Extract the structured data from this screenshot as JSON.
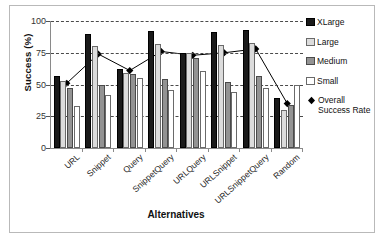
{
  "chart_data": {
    "type": "bar",
    "title": "",
    "xlabel": "Alternatives",
    "ylabel": "Success (%)",
    "ylim": [
      0,
      100
    ],
    "yticks": [
      0,
      25,
      50,
      75,
      100
    ],
    "grid": true,
    "legend_position": "right",
    "categories": [
      "URL",
      "Snippet",
      "Query",
      "SnippetQuery",
      "URLQuery",
      "URLSnippet",
      "URLSnippetQuery",
      "Random"
    ],
    "series": [
      {
        "name": "XLarge",
        "color": "#1a1a1a",
        "values": [
          57,
          90,
          62,
          92,
          75,
          91,
          93,
          39
        ]
      },
      {
        "name": "Large",
        "color": "#dcdcdc",
        "values": [
          53,
          80,
          59,
          82,
          75,
          81,
          83,
          30
        ]
      },
      {
        "name": "Medium",
        "color": "#939393",
        "values": [
          47,
          50,
          58,
          54,
          71,
          52,
          57,
          34
        ]
      },
      {
        "name": "Small",
        "color": "#ffffff",
        "values": [
          33,
          42,
          55,
          46,
          61,
          44,
          47,
          50
        ]
      }
    ],
    "line_series": {
      "name": "Overall Success Rate",
      "marker": "diamond",
      "color": "#000000",
      "values": [
        51,
        74,
        61,
        76,
        73,
        75,
        78,
        35
      ]
    }
  },
  "legend": {
    "items": [
      {
        "label": "XLarge",
        "swatch": "xlarge-swatch"
      },
      {
        "label": "Large",
        "swatch": "large-swatch"
      },
      {
        "label": "Medium",
        "swatch": "medium-swatch"
      },
      {
        "label": "Small",
        "swatch": "small-swatch"
      },
      {
        "label": "Overall",
        "label2": "Success Rate",
        "swatch": "diamond-marker"
      }
    ]
  }
}
